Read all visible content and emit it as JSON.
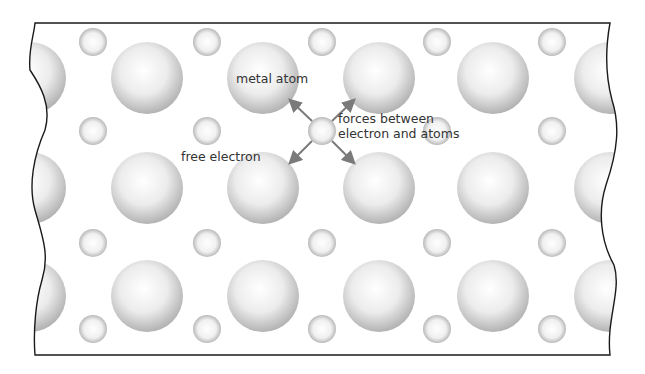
{
  "diagram": {
    "labels": {
      "metal_atom": "metal atom",
      "free_electron": "free electron",
      "forces_line1": "forces between",
      "forces_line2": "electron and atoms"
    },
    "colors": {
      "frame": "#1a1a1a",
      "atom_light": "#ffffff",
      "atom_mid": "#e6e6e6",
      "atom_dark": "#b5b5b5",
      "arrow": "#7a7a7a",
      "text": "#333333"
    },
    "atom_radius": 36,
    "electron_radius": 14,
    "atom_columns_x": [
      30,
      147,
      263,
      379,
      493,
      610
    ],
    "atom_rows_y": [
      78,
      188,
      296
    ],
    "electron_columns_x": [
      93,
      207,
      322,
      437,
      552
    ],
    "electron_rows_y": [
      42,
      131,
      243,
      329
    ],
    "highlighted_electron": {
      "x": 322,
      "y": 131
    },
    "force_arrows": [
      {
        "from": [
          312,
          121
        ],
        "to": [
          291,
          101
        ]
      },
      {
        "from": [
          332,
          121
        ],
        "to": [
          353,
          101
        ]
      },
      {
        "from": [
          312,
          141
        ],
        "to": [
          291,
          162
        ]
      },
      {
        "from": [
          332,
          141
        ],
        "to": [
          353,
          162
        ]
      }
    ]
  }
}
